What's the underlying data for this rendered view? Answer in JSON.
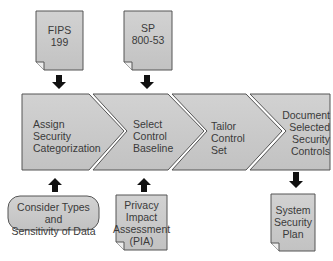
{
  "colors": {
    "shape_fill": "#cccccc",
    "shape_stroke": "#555555",
    "arrow": "#111111",
    "text": "#3a3a3a"
  },
  "inputs": {
    "fips": "FIPS\n199",
    "sp": "SP\n800-53",
    "consider": "Consider Types and\nSensitivity of Data",
    "pia": "Privacy\nImpact\nAssessment\n(PIA)"
  },
  "steps": [
    {
      "label": "Assign\nSecurity\nCategorization"
    },
    {
      "label": "Select\nControl\nBaseline"
    },
    {
      "label": "Tailor\nControl\nSet"
    },
    {
      "label": "Document\nSelected\nSecurity\nControls"
    }
  ],
  "output": {
    "ssp": "System\nSecurity\nPlan"
  }
}
